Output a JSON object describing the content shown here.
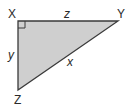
{
  "diagram": {
    "type": "right-triangle",
    "fill_color": "#cfcfcf",
    "stroke_color": "#3a3a3a",
    "vertices": [
      {
        "label": "X",
        "x": 18,
        "y": 21,
        "right_angle": true
      },
      {
        "label": "Y",
        "x": 118,
        "y": 21
      },
      {
        "label": "Z",
        "x": 18,
        "y": 90
      }
    ],
    "sides": [
      {
        "label": "z",
        "between": "X-Y"
      },
      {
        "label": "y",
        "between": "X-Z"
      },
      {
        "label": "x",
        "between": "Y-Z"
      }
    ]
  }
}
